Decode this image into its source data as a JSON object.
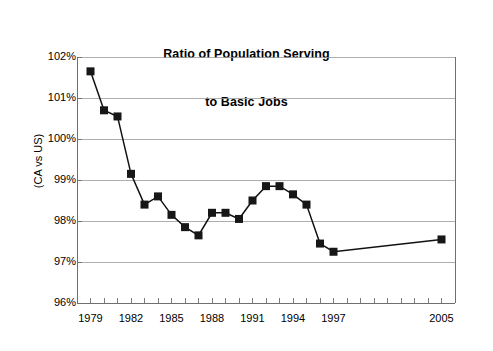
{
  "chart_data": {
    "type": "line",
    "title": "Ratio of Population Serving to Basic Jobs",
    "title_lines": [
      "Ratio of Population Serving",
      "to Basic Jobs"
    ],
    "xlabel": "",
    "ylabel": "(CA vs US)",
    "ylim": [
      96,
      102
    ],
    "y_unit": "%",
    "grid": true,
    "legend": null,
    "x_tick_labels": [
      "1979",
      "1982",
      "1985",
      "1988",
      "1991",
      "1994",
      "1997",
      "2005"
    ],
    "x_tick_values": [
      1979,
      1982,
      1985,
      1988,
      1991,
      1994,
      1997,
      2005
    ],
    "y_tick_labels": [
      "96%",
      "97%",
      "98%",
      "99%",
      "100%",
      "101%",
      "102%"
    ],
    "y_tick_values": [
      96,
      97,
      98,
      99,
      100,
      101,
      102
    ],
    "x": [
      1979,
      1980,
      1981,
      1982,
      1983,
      1984,
      1985,
      1986,
      1987,
      1988,
      1989,
      1990,
      1991,
      1992,
      1993,
      1994,
      1995,
      1996,
      1997,
      2005
    ],
    "values": [
      101.65,
      100.7,
      100.55,
      99.15,
      98.4,
      98.6,
      98.15,
      97.85,
      97.65,
      98.2,
      98.2,
      98.05,
      98.5,
      98.85,
      98.85,
      98.65,
      98.4,
      97.45,
      97.25,
      97.55
    ],
    "series": [
      {
        "name": "Ratio of Population Serving to Basic Jobs",
        "x": [
          1979,
          1980,
          1981,
          1982,
          1983,
          1984,
          1985,
          1986,
          1987,
          1988,
          1989,
          1990,
          1991,
          1992,
          1993,
          1994,
          1995,
          1996,
          1997,
          2005
        ],
        "values": [
          101.65,
          100.7,
          100.55,
          99.15,
          98.4,
          98.6,
          98.15,
          97.85,
          97.65,
          98.2,
          98.2,
          98.05,
          98.5,
          98.85,
          98.85,
          98.65,
          98.4,
          97.45,
          97.25,
          97.55
        ],
        "marker": "square",
        "color": "#171717"
      }
    ],
    "colors": {
      "line": "#171717",
      "marker": "#171717",
      "grid": "#9a9a9a",
      "axis": "#6f6f6f",
      "background": "#ffffff",
      "text": "#000000"
    }
  }
}
